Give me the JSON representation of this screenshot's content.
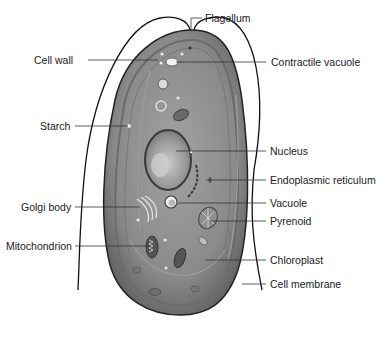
{
  "diagram": {
    "title": "",
    "colors": {
      "background": "#ffffff",
      "cytoplasm": "#8c8c8c",
      "cytoplasm_dark": "#5e5e5e",
      "chloroplast_light": "#a8a8a8",
      "outline": "#111111",
      "leader_line": "#333333",
      "text": "#1a1a1a"
    },
    "labels_left": [
      {
        "id": "cell-wall",
        "text": "Cell wall"
      },
      {
        "id": "starch",
        "text": "Starch"
      },
      {
        "id": "golgi-body",
        "text": "Golgi body"
      },
      {
        "id": "mitochondrion",
        "text": "Mitochondrion"
      }
    ],
    "labels_right": [
      {
        "id": "flagellum",
        "text": "Flagellum"
      },
      {
        "id": "contractile-vacuole",
        "text": "Contractile vacuole"
      },
      {
        "id": "nucleus",
        "text": "Nucleus"
      },
      {
        "id": "endoplasmic-reticulum",
        "text": "Endoplasmic reticulum"
      },
      {
        "id": "vacuole",
        "text": "Vacuole"
      },
      {
        "id": "pyrenoid",
        "text": "Pyrenoid"
      },
      {
        "id": "chloroplast",
        "text": "Chloroplast"
      },
      {
        "id": "cell-membrane",
        "text": "Cell membrane"
      }
    ]
  }
}
